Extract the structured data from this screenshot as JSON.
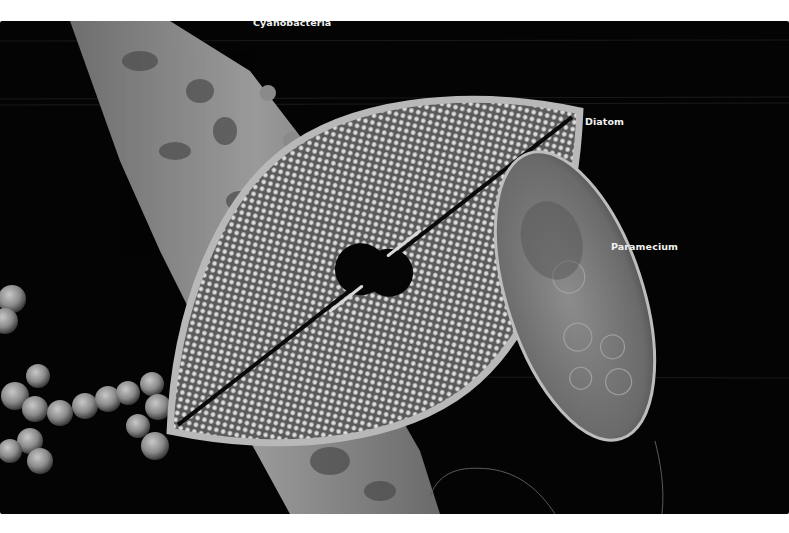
{
  "figure": {
    "background_color": "#040404",
    "label_color": "#f2f2f2",
    "labels": [
      {
        "id": "cyanobacteria",
        "text": "Cyanobacteria",
        "x": 253,
        "y": 13
      },
      {
        "id": "diatom",
        "text": "Diatom",
        "x": 585,
        "y": 95
      },
      {
        "id": "paramecium",
        "text": "Paramecium",
        "x": 611,
        "y": 220
      }
    ],
    "organisms": [
      "cyanobacteria filament",
      "diatom",
      "paramecium",
      "bacterial cocci chain"
    ]
  }
}
